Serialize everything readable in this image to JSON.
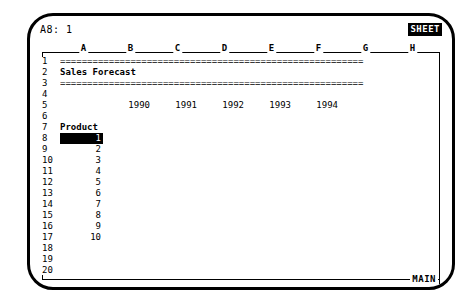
{
  "app": {
    "mode_badge": "SHEET",
    "footer_label": "MAIN"
  },
  "cell_ref_bar": {
    "reference": "A8: 1"
  },
  "grid": {
    "columns": [
      "A",
      "B",
      "C",
      "D",
      "E",
      "F",
      "G",
      "H"
    ],
    "rows": [
      "1",
      "2",
      "3",
      "4",
      "5",
      "6",
      "7",
      "8",
      "9",
      "10",
      "11",
      "12",
      "13",
      "14",
      "15",
      "16",
      "17",
      "18",
      "19",
      "20"
    ]
  },
  "sheet": {
    "separator_top": "========================================================",
    "separator_bottom": "========================================================",
    "title": "Sales Forecast",
    "product_header": "Product",
    "years": [
      "1990",
      "1991",
      "1992",
      "1993",
      "1994"
    ],
    "products": [
      "1",
      "2",
      "3",
      "4",
      "5",
      "6",
      "7",
      "8",
      "9",
      "10"
    ],
    "selected_cell_value": "1"
  },
  "colors": {
    "ink": "#000000",
    "paper": "#ffffff",
    "highlight_bg": "#000000",
    "highlight_fg": "#ffffff"
  }
}
